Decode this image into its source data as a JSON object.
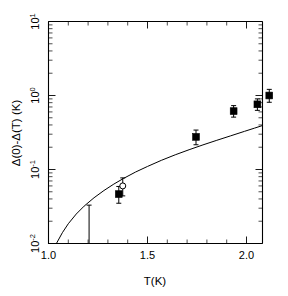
{
  "figure": {
    "background": "#ffffff",
    "ink_color": "#000000"
  },
  "chart_data": {
    "type": "scatter",
    "title": "",
    "subtitle": "",
    "xlabel": "T(K)",
    "ylabel": "Δ(0)-Δ(T)   (K)",
    "xscale": "linear",
    "yscale": "log",
    "xlim": [
      1.0,
      2.08
    ],
    "ylim": [
      0.01,
      10
    ],
    "grid": false,
    "legend": "none",
    "x_ticks_major": [
      "1.0",
      "1.5",
      "2.0"
    ],
    "x_tick_values": [
      1.0,
      1.5,
      2.0
    ],
    "x_minor_step": 0.1,
    "y_ticks_major": [
      "10¹",
      "10⁰",
      "10⁻¹",
      "10⁻²"
    ],
    "y_tick_values": [
      10,
      1,
      0.1,
      0.01
    ],
    "y_tick_label_parts": [
      {
        "base": "10",
        "exp": "1"
      },
      {
        "base": "10",
        "exp": "0"
      },
      {
        "base": "10",
        "exp": "-1"
      },
      {
        "base": "10",
        "exp": "-2"
      }
    ],
    "series": [
      {
        "name": "filled squares",
        "marker": "filled-square",
        "points": [
          {
            "x": 1.355,
            "y": 0.0465,
            "yerr_low": 0.0115,
            "yerr_high": 0.0125
          },
          {
            "x": 1.745,
            "y": 0.276,
            "yerr_low": 0.06,
            "yerr_high": 0.065
          },
          {
            "x": 1.935,
            "y": 0.615,
            "yerr_low": 0.105,
            "yerr_high": 0.115
          },
          {
            "x": 2.055,
            "y": 0.76,
            "yerr_low": 0.13,
            "yerr_high": 0.14
          },
          {
            "x": 2.115,
            "y": 1.0,
            "yerr_low": 0.19,
            "yerr_high": 0.21
          }
        ]
      },
      {
        "name": "open circle",
        "marker": "open-circle",
        "points": [
          {
            "x": 1.375,
            "y": 0.06,
            "yerr_low": 0.016,
            "yerr_high": 0.017
          }
        ]
      },
      {
        "name": "lower-limit bar",
        "marker": "errorbar-only",
        "points": [
          {
            "x": 1.205,
            "y": 0.0205,
            "yerr_low": 0.0105,
            "yerr_high": 0.0125
          }
        ]
      }
    ],
    "fit_curve": {
      "name": "BCS-like fit",
      "style": "solid",
      "x_start": 1.04,
      "x_end": 2.08,
      "points": [
        {
          "x": 1.04,
          "y": 0.01
        },
        {
          "x": 1.07,
          "y": 0.014
        },
        {
          "x": 1.1,
          "y": 0.0185
        },
        {
          "x": 1.14,
          "y": 0.025
        },
        {
          "x": 1.18,
          "y": 0.032
        },
        {
          "x": 1.23,
          "y": 0.0415
        },
        {
          "x": 1.28,
          "y": 0.052
        },
        {
          "x": 1.33,
          "y": 0.0635
        },
        {
          "x": 1.38,
          "y": 0.076
        },
        {
          "x": 1.44,
          "y": 0.0925
        },
        {
          "x": 1.5,
          "y": 0.11
        },
        {
          "x": 1.57,
          "y": 0.133
        },
        {
          "x": 1.64,
          "y": 0.158
        },
        {
          "x": 1.71,
          "y": 0.185
        },
        {
          "x": 1.78,
          "y": 0.215
        },
        {
          "x": 1.85,
          "y": 0.248
        },
        {
          "x": 1.92,
          "y": 0.285
        },
        {
          "x": 1.99,
          "y": 0.328
        },
        {
          "x": 2.04,
          "y": 0.362
        },
        {
          "x": 2.08,
          "y": 0.392
        }
      ]
    }
  }
}
